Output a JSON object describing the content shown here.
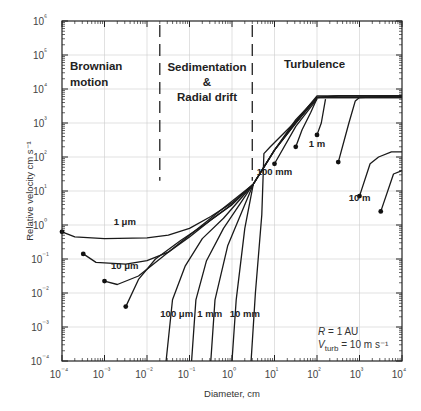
{
  "chart_data": {
    "type": "line",
    "title": "",
    "xlabel": "Diameter, cm",
    "ylabel": "Relative velocity  cm s⁻¹",
    "xscale": "log",
    "yscale": "log",
    "xlim": [
      0.0001,
      10000
    ],
    "ylim": [
      0.0001,
      1000000
    ],
    "grid": true,
    "x_ticks": [
      "10⁻⁴",
      "10⁻³",
      "10⁻²",
      "10⁻¹",
      "10⁰",
      "10¹",
      "10²",
      "10³",
      "10⁴"
    ],
    "y_ticks": [
      "10⁻⁴",
      "10⁻³",
      "10⁻²",
      "10⁻¹",
      "10⁰",
      "10¹",
      "10²",
      "10³",
      "10⁴",
      "10⁵",
      "10⁶"
    ],
    "regions": [
      {
        "name": "Brownian motion",
        "lines": [
          "Brownian",
          "motion"
        ]
      },
      {
        "name": "Sedimentation & Radial drift",
        "lines": [
          "Sedimentation",
          "&",
          "Radial drift"
        ]
      },
      {
        "name": "Turbulence",
        "lines": [
          "Turbulence"
        ]
      }
    ],
    "region_boundaries_cm": [
      0.02,
      3
    ],
    "annotation": {
      "R": "R = 1 AU",
      "Vturb_prefix": "V",
      "Vturb_sub": "turb",
      "Vturb_suffix": " = 10 m s⁻¹"
    },
    "series": [
      {
        "name": "1 μm",
        "partner_diameter_cm": 0.0001,
        "points_log": [
          [
            -4,
            -0.2
          ],
          [
            -3.7,
            -0.35
          ],
          [
            -3,
            -0.4
          ],
          [
            -2,
            -0.38
          ],
          [
            -1.5,
            -0.3
          ],
          [
            -1,
            -0.1
          ],
          [
            -0.5,
            0.25
          ],
          [
            0,
            0.65
          ],
          [
            0.5,
            1.2
          ],
          [
            1,
            2.2
          ],
          [
            1.5,
            3.1
          ],
          [
            2,
            3.75
          ],
          [
            2.5,
            3.8
          ],
          [
            3,
            3.8
          ],
          [
            4,
            3.8
          ]
        ]
      },
      {
        "name": "10 μm",
        "partner_diameter_cm": 0.001,
        "points_log": [
          [
            -3.5,
            -0.85
          ],
          [
            -3.2,
            -1.1
          ],
          [
            -2.5,
            -1.15
          ],
          [
            -2,
            -1.05
          ],
          [
            -1.5,
            -0.8
          ],
          [
            -1,
            -0.35
          ],
          [
            -0.5,
            0.15
          ],
          [
            0,
            0.6
          ],
          [
            0.5,
            1.2
          ],
          [
            1,
            2.2
          ],
          [
            1.5,
            3.05
          ],
          [
            2,
            3.75
          ],
          [
            2.5,
            3.8
          ],
          [
            4,
            3.8
          ]
        ]
      },
      {
        "name": "30 μm",
        "partner_diameter_cm": 0.003,
        "points_log": [
          [
            -3,
            -1.65
          ],
          [
            -2.7,
            -1.75
          ],
          [
            -2.2,
            -1.5
          ],
          [
            -1.7,
            -1.0
          ],
          [
            -1.2,
            -0.5
          ],
          [
            -0.7,
            0.0
          ],
          [
            -0.2,
            0.5
          ],
          [
            0.5,
            1.2
          ],
          [
            1,
            2.2
          ],
          [
            1.5,
            3.0
          ],
          [
            2,
            3.75
          ],
          [
            4,
            3.75
          ]
        ]
      },
      {
        "name": "100 μm",
        "partner_diameter_cm": 0.01,
        "points_log": [
          [
            -2.5,
            -2.4
          ],
          [
            -2.2,
            -1.6
          ],
          [
            -1.8,
            -1.0
          ],
          [
            -1.2,
            -0.45
          ],
          [
            -0.6,
            0.05
          ],
          [
            0,
            0.6
          ],
          [
            0.5,
            1.2
          ],
          [
            1,
            2.2
          ],
          [
            1.5,
            3.0
          ],
          [
            2,
            3.75
          ],
          [
            4,
            3.75
          ]
        ]
      },
      {
        "name": "300 μm",
        "partner_diameter_cm": 0.03,
        "points_log": [
          [
            -1.55,
            -4.0
          ],
          [
            -1.4,
            -2.2
          ],
          [
            -1.1,
            -1.2
          ],
          [
            -0.7,
            -0.4
          ],
          [
            -0.2,
            0.2
          ],
          [
            0.5,
            1.2
          ]
        ]
      },
      {
        "name": "1 mm",
        "partner_diameter_cm": 0.1,
        "points_log": [
          [
            -0.95,
            -4.0
          ],
          [
            -0.85,
            -2.2
          ],
          [
            -0.6,
            -1.05
          ],
          [
            -0.2,
            -0.1
          ],
          [
            0.5,
            1.2
          ]
        ]
      },
      {
        "name": "3 mm",
        "partner_diameter_cm": 0.3,
        "points_log": [
          [
            -0.5,
            -4.0
          ],
          [
            -0.4,
            -2.2
          ],
          [
            -0.1,
            -0.6
          ],
          [
            0.5,
            1.2
          ]
        ]
      },
      {
        "name": "10 mm",
        "partner_diameter_cm": 1,
        "points_log": [
          [
            0.0,
            -4.0
          ],
          [
            0.1,
            -2.2
          ],
          [
            0.3,
            -0.1
          ],
          [
            0.5,
            1.2
          ]
        ]
      },
      {
        "name": "30 mm",
        "partner_diameter_cm": 3,
        "points_log": [
          [
            0.45,
            -4.0
          ],
          [
            0.55,
            -2.0
          ],
          [
            0.7,
            0.3
          ],
          [
            0.75,
            2.1
          ],
          [
            0.9,
            2.3
          ],
          [
            1.5,
            3.05
          ],
          [
            2,
            3.8
          ],
          [
            4,
            3.8
          ]
        ]
      },
      {
        "name": "100 mm",
        "partner_diameter_cm": 10,
        "points_log": [
          [
            1,
            1.8
          ],
          [
            1.5,
            2.9
          ],
          [
            2,
            3.7
          ]
        ]
      },
      {
        "name": "30 cm",
        "partner_diameter_cm": 30,
        "points_log": [
          [
            1.5,
            2.3
          ],
          [
            1.65,
            2.8
          ],
          [
            1.85,
            3.3
          ],
          [
            2,
            3.72
          ]
        ]
      },
      {
        "name": "1 m",
        "partner_diameter_cm": 100,
        "points_log": [
          [
            2,
            2.65
          ],
          [
            2.1,
            3.0
          ],
          [
            2.2,
            3.7
          ]
        ]
      },
      {
        "name": "3 m",
        "partner_diameter_cm": 300,
        "points_log": [
          [
            2.5,
            1.85
          ],
          [
            2.75,
            3.0
          ],
          [
            2.9,
            3.65
          ],
          [
            3,
            3.75
          ],
          [
            4,
            3.8
          ]
        ]
      },
      {
        "name": "10 m",
        "partner_diameter_cm": 1000,
        "points_log": [
          [
            3,
            0.85
          ],
          [
            3.25,
            1.8
          ],
          [
            3.45,
            2.0
          ],
          [
            3.75,
            2.15
          ],
          [
            4,
            2.15
          ]
        ]
      },
      {
        "name": "30 m",
        "partner_diameter_cm": 3000,
        "points_log": [
          [
            3.5,
            0.4
          ],
          [
            3.8,
            1.5
          ],
          [
            4,
            1.6
          ]
        ]
      }
    ],
    "curve_labels": [
      {
        "text": "1 μm",
        "x": 0.003,
        "y": 1.0
      },
      {
        "text": "10 μm",
        "x": 0.003,
        "y": 0.05
      },
      {
        "text": "100 μm",
        "x": 0.05,
        "y": 0.002
      },
      {
        "text": "1 mm",
        "x": 0.3,
        "y": 0.002
      },
      {
        "text": "10 mm",
        "x": 2,
        "y": 0.002
      },
      {
        "text": "100 mm",
        "x": 10,
        "y": 30
      },
      {
        "text": "1 m",
        "x": 100,
        "y": 200
      },
      {
        "text": "10 m",
        "x": 1000,
        "y": 5
      }
    ]
  }
}
